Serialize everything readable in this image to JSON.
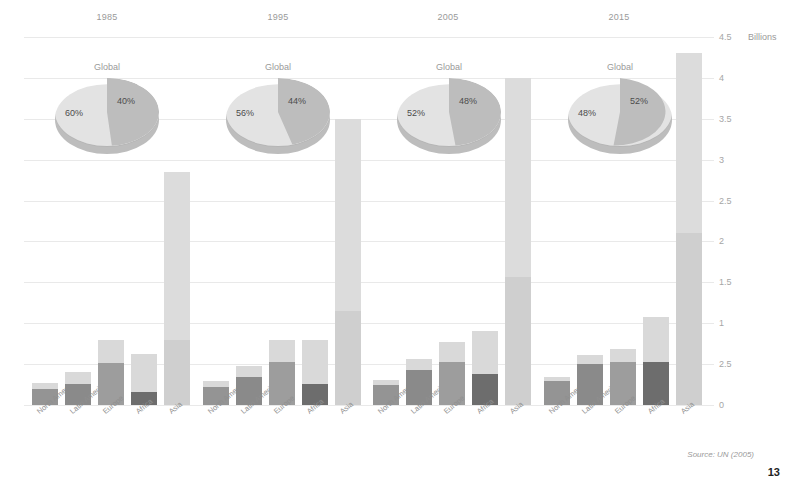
{
  "figure": {
    "unit_label": "Billions",
    "pie_title": "Global",
    "source_note": "Source: UN (2005)",
    "page_number": "13"
  },
  "axis": {
    "min": 0,
    "max": 4.5,
    "tick_labels": [
      "4.5",
      "4",
      "3.5",
      "3",
      "2.5",
      "2",
      "1.5",
      "1",
      "2.5",
      "0"
    ],
    "tick_values": [
      4.5,
      4.0,
      3.5,
      3.0,
      2.5,
      2.0,
      1.5,
      1.0,
      0.5,
      0.0
    ]
  },
  "colors": {
    "urban": "#8e8e8e",
    "rural": "#d9d9d9",
    "pie_urban": "#bdbdbd",
    "pie_rural": "#e3e3e3",
    "gridline": "#e9e9e9",
    "text": "#9a9a9a"
  },
  "categories": [
    "North America",
    "Latin America",
    "Europe",
    "Africa",
    "Asia"
  ],
  "groups": [
    {
      "year": "1985",
      "pie": {
        "rural_pct": "60%",
        "urban_pct": "40%",
        "rural": 60,
        "urban": 40
      },
      "bars": [
        {
          "category": "North America",
          "urban": 0.2,
          "rural": 0.07,
          "total": 0.27
        },
        {
          "category": "Latin America",
          "urban": 0.26,
          "rural": 0.14,
          "total": 0.4
        },
        {
          "category": "Europe",
          "urban": 0.51,
          "rural": 0.28,
          "total": 0.79
        },
        {
          "category": "Africa",
          "urban": 0.16,
          "rural": 0.47,
          "total": 0.63
        },
        {
          "category": "Asia",
          "urban": 0.8,
          "rural": 2.05,
          "total": 2.85
        }
      ]
    },
    {
      "year": "1995",
      "pie": {
        "rural_pct": "56%",
        "urban_pct": "44%",
        "rural": 56,
        "urban": 44
      },
      "bars": [
        {
          "category": "North America",
          "urban": 0.22,
          "rural": 0.07,
          "total": 0.29
        },
        {
          "category": "Latin America",
          "urban": 0.34,
          "rural": 0.14,
          "total": 0.48
        },
        {
          "category": "Europe",
          "urban": 0.52,
          "rural": 0.28,
          "total": 0.8
        },
        {
          "category": "Africa",
          "urban": 0.26,
          "rural": 0.54,
          "total": 0.8
        },
        {
          "category": "Asia",
          "urban": 1.15,
          "rural": 2.35,
          "total": 3.5
        }
      ]
    },
    {
      "year": "2005",
      "pie": {
        "rural_pct": "52%",
        "urban_pct": "48%",
        "rural": 52,
        "urban": 48
      },
      "bars": [
        {
          "category": "North America",
          "urban": 0.25,
          "rural": 0.06,
          "total": 0.31
        },
        {
          "category": "Latin America",
          "urban": 0.43,
          "rural": 0.13,
          "total": 0.56
        },
        {
          "category": "Europe",
          "urban": 0.52,
          "rural": 0.25,
          "total": 0.77
        },
        {
          "category": "Africa",
          "urban": 0.38,
          "rural": 0.53,
          "total": 0.91
        },
        {
          "category": "Asia",
          "urban": 1.56,
          "rural": 2.44,
          "total": 4.0
        }
      ]
    },
    {
      "year": "2015",
      "pie": {
        "rural_pct": "48%",
        "urban_pct": "52%",
        "rural": 48,
        "urban": 52
      },
      "bars": [
        {
          "category": "North America",
          "urban": 0.29,
          "rural": 0.05,
          "total": 0.34
        },
        {
          "category": "Latin America",
          "urban": 0.5,
          "rural": 0.11,
          "total": 0.61
        },
        {
          "category": "Europe",
          "urban": 0.53,
          "rural": 0.16,
          "total": 0.69
        },
        {
          "category": "Africa",
          "urban": 0.53,
          "rural": 0.55,
          "total": 1.08
        },
        {
          "category": "Asia",
          "urban": 2.1,
          "rural": 2.2,
          "total": 4.3
        }
      ]
    }
  ],
  "chart_data": {
    "type": "bar",
    "title": "",
    "subtitle": "",
    "xlabel": "",
    "ylabel": "Billions",
    "ylim": [
      0,
      4.5
    ],
    "grid": true,
    "stacked": true,
    "legend": null,
    "annotations": [
      "Source: UN (2005)"
    ],
    "panels": [
      "1985",
      "1995",
      "2005",
      "2015"
    ],
    "categories": [
      "North America",
      "Latin America",
      "Europe",
      "Africa",
      "Asia"
    ],
    "series": [
      {
        "name": "Urban",
        "values_by_panel": {
          "1985": [
            0.2,
            0.26,
            0.51,
            0.16,
            0.8
          ],
          "1995": [
            0.22,
            0.34,
            0.52,
            0.26,
            1.15
          ],
          "2005": [
            0.25,
            0.43,
            0.52,
            0.38,
            1.56
          ],
          "2015": [
            0.29,
            0.5,
            0.53,
            0.53,
            2.1
          ]
        }
      },
      {
        "name": "Rural",
        "values_by_panel": {
          "1985": [
            0.07,
            0.14,
            0.28,
            0.47,
            2.05
          ],
          "1995": [
            0.07,
            0.14,
            0.28,
            0.54,
            2.35
          ],
          "2005": [
            0.06,
            0.13,
            0.25,
            0.53,
            2.44
          ],
          "2015": [
            0.05,
            0.11,
            0.16,
            0.55,
            2.2
          ]
        }
      }
    ],
    "totals_by_panel": {
      "1985": [
        0.27,
        0.4,
        0.79,
        0.63,
        2.85
      ],
      "1995": [
        0.29,
        0.48,
        0.8,
        0.8,
        3.5
      ],
      "2005": [
        0.31,
        0.56,
        0.77,
        0.91,
        4.0
      ],
      "2015": [
        0.34,
        0.61,
        0.69,
        1.08,
        4.3
      ]
    },
    "pies": {
      "type": "pie",
      "title": "Global",
      "labels": [
        "Rural",
        "Urban"
      ],
      "panels": {
        "1985": [
          60,
          40
        ],
        "1995": [
          56,
          44
        ],
        "2005": [
          52,
          48
        ],
        "2015": [
          48,
          52
        ]
      }
    }
  }
}
